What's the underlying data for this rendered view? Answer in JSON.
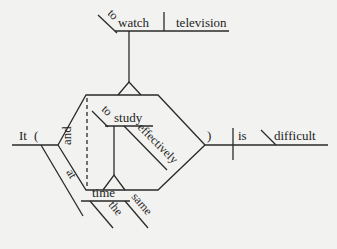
{
  "diagram": {
    "type": "Reed-Kellogg sentence diagram",
    "sentence_parts": {
      "subject_expletive": "It",
      "open_paren": "(",
      "close_paren": ")",
      "verb": "is",
      "complement": "difficult",
      "upper_infinitive": {
        "marker": "to",
        "verb": "watch",
        "object": "television"
      },
      "lower_infinitive": {
        "marker": "to",
        "verb": "study",
        "modifier": "effectively"
      },
      "conjunction": "and",
      "prepositional_phrase": {
        "preposition": "at",
        "object": "time",
        "modifiers": [
          "the",
          "same"
        ]
      }
    },
    "colors": {
      "line": "#2a2a2a",
      "text": "#1e1e1e",
      "background": "#f2f2f0"
    }
  }
}
